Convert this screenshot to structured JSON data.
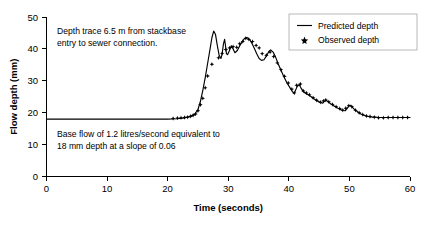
{
  "chart_data": {
    "type": "line",
    "title": "",
    "xlabel": "Time (seconds)",
    "ylabel": "Flow depth (mm)",
    "xlim": [
      0,
      60
    ],
    "ylim": [
      0,
      50
    ],
    "xticks": [
      0,
      10,
      20,
      30,
      40,
      50,
      60
    ],
    "yticks": [
      0,
      10,
      20,
      30,
      40,
      50
    ],
    "grid": false,
    "legend_position": "top-right",
    "legend": [
      {
        "name": "Predicted depth",
        "marker": "line"
      },
      {
        "name": "Observed depth",
        "marker": "point"
      }
    ],
    "annotations": [
      "Depth trace 6.5 m from stackbase entry to sewer connection.",
      "Base flow of 1.2 litres/second equivalent to 18 mm depth at a slope of 0.06"
    ],
    "series": [
      {
        "name": "Predicted depth",
        "type": "line",
        "points": [
          [
            0.0,
            18.0
          ],
          [
            4.0,
            18.0
          ],
          [
            8.0,
            18.0
          ],
          [
            12.0,
            18.0
          ],
          [
            16.0,
            18.0
          ],
          [
            20.0,
            18.0
          ],
          [
            21.5,
            18.1
          ],
          [
            22.5,
            18.3
          ],
          [
            23.3,
            18.6
          ],
          [
            24.0,
            19.0
          ],
          [
            24.5,
            19.6
          ],
          [
            25.0,
            21.0
          ],
          [
            25.4,
            23.5
          ],
          [
            25.8,
            27.0
          ],
          [
            26.2,
            31.0
          ],
          [
            26.6,
            35.5
          ],
          [
            27.0,
            40.0
          ],
          [
            27.3,
            43.5
          ],
          [
            27.6,
            45.6
          ],
          [
            27.9,
            44.5
          ],
          [
            28.2,
            41.0
          ],
          [
            28.5,
            38.0
          ],
          [
            28.8,
            37.0
          ],
          [
            29.0,
            38.5
          ],
          [
            29.2,
            41.5
          ],
          [
            29.4,
            43.0
          ],
          [
            29.55,
            41.0
          ],
          [
            29.7,
            38.5
          ],
          [
            29.9,
            38.2
          ],
          [
            30.2,
            39.5
          ],
          [
            30.5,
            41.0
          ],
          [
            30.8,
            40.0
          ],
          [
            31.1,
            38.8
          ],
          [
            31.5,
            39.5
          ],
          [
            31.9,
            41.0
          ],
          [
            32.3,
            42.3
          ],
          [
            32.7,
            43.3
          ],
          [
            33.1,
            43.6
          ],
          [
            33.5,
            43.0
          ],
          [
            33.9,
            41.8
          ],
          [
            34.3,
            40.2
          ],
          [
            34.7,
            38.5
          ],
          [
            35.1,
            37.0
          ],
          [
            35.5,
            36.4
          ],
          [
            35.9,
            36.6
          ],
          [
            36.3,
            37.8
          ],
          [
            36.7,
            39.2
          ],
          [
            37.0,
            39.7
          ],
          [
            37.4,
            39.0
          ],
          [
            37.8,
            37.5
          ],
          [
            38.2,
            35.5
          ],
          [
            38.7,
            33.3
          ],
          [
            39.2,
            31.2
          ],
          [
            39.7,
            29.3
          ],
          [
            40.2,
            27.8
          ],
          [
            40.6,
            26.6
          ],
          [
            40.9,
            26.0
          ],
          [
            41.1,
            27.0
          ],
          [
            41.4,
            28.3
          ],
          [
            41.7,
            28.8
          ],
          [
            42.0,
            27.8
          ],
          [
            42.4,
            26.6
          ],
          [
            42.8,
            26.0
          ],
          [
            43.2,
            25.6
          ],
          [
            43.7,
            25.0
          ],
          [
            44.2,
            24.3
          ],
          [
            44.7,
            23.7
          ],
          [
            45.2,
            23.2
          ],
          [
            45.6,
            23.0
          ],
          [
            45.9,
            23.6
          ],
          [
            46.2,
            23.8
          ],
          [
            46.5,
            23.4
          ],
          [
            46.9,
            22.8
          ],
          [
            47.4,
            22.2
          ],
          [
            47.9,
            21.6
          ],
          [
            48.4,
            21.1
          ],
          [
            48.9,
            20.7
          ],
          [
            49.3,
            20.6
          ],
          [
            49.6,
            21.3
          ],
          [
            49.9,
            22.1
          ],
          [
            50.2,
            22.3
          ],
          [
            50.5,
            21.7
          ],
          [
            50.9,
            20.9
          ],
          [
            51.4,
            20.2
          ],
          [
            51.9,
            19.6
          ],
          [
            52.4,
            19.2
          ],
          [
            52.9,
            18.9
          ],
          [
            53.5,
            18.7
          ],
          [
            54.2,
            18.6
          ],
          [
            55.0,
            18.5
          ],
          [
            56.0,
            18.5
          ],
          [
            57.0,
            18.5
          ],
          [
            58.0,
            18.5
          ],
          [
            59.0,
            18.5
          ],
          [
            60.0,
            18.5
          ]
        ]
      },
      {
        "name": "Observed depth",
        "type": "scatter",
        "points": [
          [
            20.9,
            18.2
          ],
          [
            21.6,
            18.3
          ],
          [
            22.2,
            18.4
          ],
          [
            22.8,
            18.5
          ],
          [
            23.3,
            18.6
          ],
          [
            23.8,
            18.9
          ],
          [
            24.2,
            19.2
          ],
          [
            24.6,
            19.6
          ],
          [
            25.0,
            20.6
          ],
          [
            25.4,
            22.5
          ],
          [
            25.8,
            24.5
          ],
          [
            26.2,
            27.8
          ],
          [
            26.6,
            31.5
          ],
          [
            27.3,
            35.2
          ],
          [
            28.4,
            37.2
          ],
          [
            29.0,
            38.6
          ],
          [
            29.6,
            39.8
          ],
          [
            30.2,
            40.3
          ],
          [
            30.8,
            40.7
          ],
          [
            31.4,
            40.5
          ],
          [
            31.9,
            41.6
          ],
          [
            32.4,
            42.3
          ],
          [
            32.9,
            43.3
          ],
          [
            33.4,
            43.0
          ],
          [
            34.0,
            42.3
          ],
          [
            34.6,
            41.1
          ],
          [
            35.1,
            40.3
          ],
          [
            35.6,
            38.5
          ],
          [
            36.3,
            38.0
          ],
          [
            36.9,
            39.0
          ],
          [
            37.5,
            37.6
          ],
          [
            38.1,
            35.6
          ],
          [
            38.7,
            33.5
          ],
          [
            39.3,
            31.4
          ],
          [
            39.9,
            29.3
          ],
          [
            40.5,
            27.4
          ],
          [
            40.9,
            26.2
          ],
          [
            41.3,
            28.6
          ],
          [
            41.9,
            29.0
          ],
          [
            42.4,
            26.8
          ],
          [
            42.9,
            26.2
          ],
          [
            43.4,
            25.6
          ],
          [
            44.0,
            24.7
          ],
          [
            44.6,
            23.9
          ],
          [
            45.2,
            23.3
          ],
          [
            45.7,
            23.7
          ],
          [
            46.1,
            24.0
          ],
          [
            46.6,
            23.4
          ],
          [
            47.2,
            22.6
          ],
          [
            47.8,
            21.9
          ],
          [
            48.4,
            21.3
          ],
          [
            48.9,
            20.8
          ],
          [
            49.4,
            21.4
          ],
          [
            49.9,
            22.2
          ],
          [
            50.4,
            21.9
          ],
          [
            51.0,
            20.8
          ],
          [
            51.6,
            20.0
          ],
          [
            52.2,
            19.4
          ],
          [
            52.8,
            19.0
          ],
          [
            53.4,
            18.8
          ],
          [
            54.1,
            18.6
          ],
          [
            54.8,
            18.4
          ],
          [
            55.6,
            18.4
          ],
          [
            56.4,
            18.5
          ],
          [
            57.2,
            18.5
          ],
          [
            58.0,
            18.5
          ],
          [
            58.8,
            18.5
          ],
          [
            59.6,
            18.5
          ]
        ]
      }
    ]
  },
  "axes": {
    "y_title": "Flow depth (mm)",
    "x_title": "Time (seconds)",
    "y_tick_labels": [
      "0",
      "10",
      "20",
      "30",
      "40",
      "50"
    ],
    "x_tick_labels": [
      "0",
      "10",
      "20",
      "30",
      "40",
      "50",
      "60"
    ]
  },
  "legend": {
    "predicted_label": "Predicted depth",
    "observed_label": "Observed depth"
  },
  "annotations": {
    "upper_line1": "Depth trace 6.5 m from stackbase",
    "upper_line2": "entry to sewer connection.",
    "lower_line1": "Base flow of 1.2 litres/second equivalent to",
    "lower_line2": "18 mm depth at a slope of 0.06"
  },
  "colors": {
    "line": "#000000",
    "marker": "#000000",
    "axis": "#000000",
    "background": "#ffffff"
  }
}
